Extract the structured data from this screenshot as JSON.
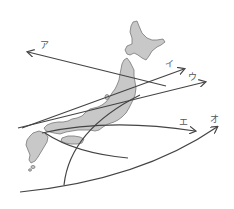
{
  "diagram": {
    "type": "map-with-arrows",
    "colors": {
      "land_fill": "#c8c8c8",
      "land_stroke": "#777777",
      "arrow": "#444444",
      "label": "#555555",
      "background": "#ffffff"
    },
    "arrows": [
      {
        "id": "a",
        "label": "ア",
        "label_pos": [
          40,
          41
        ],
        "from": [
          166,
          86
        ],
        "to": [
          28,
          52
        ]
      },
      {
        "id": "i",
        "label": "イ",
        "label_pos": [
          165,
          60
        ],
        "from": [
          22,
          128
        ],
        "to": [
          184,
          69
        ]
      },
      {
        "id": "u",
        "label": "ウ",
        "label_pos": [
          188,
          73
        ],
        "from": [
          18,
          128
        ],
        "to": [
          205,
          82
        ]
      },
      {
        "id": "e",
        "label": "エ",
        "label_pos": [
          179,
          118
        ],
        "from": [
          42,
          133
        ],
        "to": [
          195,
          131
        ]
      },
      {
        "id": "o",
        "label": "オ",
        "label_pos": [
          210,
          115
        ],
        "from": [
          20,
          192
        ],
        "to": [
          217,
          127
        ]
      }
    ]
  }
}
